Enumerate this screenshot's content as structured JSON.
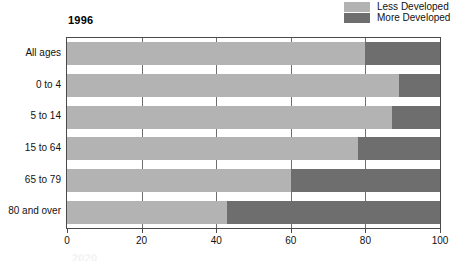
{
  "chart_data": {
    "type": "bar",
    "orientation": "horizontal",
    "stacked": true,
    "normalized": true,
    "title": "1996",
    "xlabel": "",
    "ylabel": "",
    "xlim": [
      0,
      100
    ],
    "xticks": [
      0,
      20,
      40,
      60,
      80,
      100
    ],
    "xtick_labels": [
      "0",
      "20",
      "40",
      "60",
      "80",
      "100"
    ],
    "grid": false,
    "legend_position": "top-right",
    "categories": [
      "All ages",
      "0 to 4",
      "5 to 14",
      "15 to 64",
      "65 to 79",
      "80 and over"
    ],
    "series": [
      {
        "name": "Less Developed",
        "color": "#b3b3b3",
        "values": [
          80,
          89,
          87,
          78,
          60,
          43
        ]
      },
      {
        "name": "More Developed",
        "color": "#6e6e6e",
        "values": [
          20,
          11,
          13,
          22,
          40,
          57
        ]
      }
    ]
  },
  "legend": {
    "items": [
      {
        "label": "Less Developed",
        "swatch": "less"
      },
      {
        "label": "More Developed",
        "swatch": "more"
      }
    ]
  },
  "title": "1996",
  "bottom_ghost": "2020",
  "colors": {
    "less_developed": "#b3b3b3",
    "more_developed": "#6e6e6e",
    "axis": "#4a4a4a",
    "text": "#111111",
    "background": "#ffffff"
  }
}
